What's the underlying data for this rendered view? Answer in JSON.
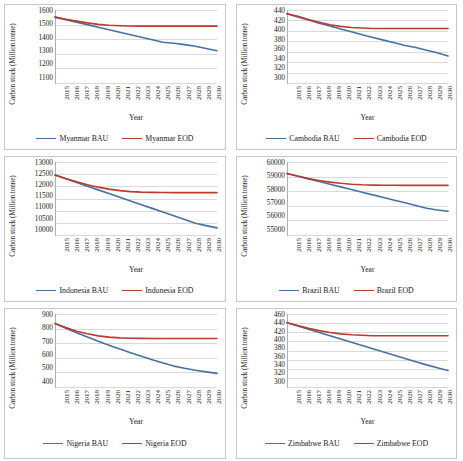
{
  "figure": {
    "layout": "2 columns x 3 rows of line charts",
    "shared_xlabel": "Year",
    "shared_ylabel": "Carbon stock (Million tonne)",
    "colors": {
      "bau_line": "#4472A4",
      "eod_line": "#BE3A2B",
      "gridline": "#D9D9D9",
      "panel_border": "#C8C8C8"
    }
  },
  "chart_data": [
    {
      "id": "myanmar",
      "type": "line",
      "title": "",
      "xlabel": "Year",
      "ylabel": "Carbon stock (Million tonne)",
      "x": [
        2015,
        2016,
        2017,
        2018,
        2019,
        2020,
        2021,
        2022,
        2023,
        2024,
        2025,
        2026,
        2027,
        2028,
        2029,
        2030
      ],
      "xtick_labels": [
        "2015",
        "2016",
        "2017",
        "2018",
        "2019",
        "2020",
        "2021",
        "2022",
        "2023",
        "2024",
        "2025",
        "2026",
        "2027",
        "2028",
        "2029",
        "2030"
      ],
      "ylim": [
        1100,
        1600
      ],
      "yticks": [
        1100,
        1200,
        1300,
        1400,
        1500,
        1600
      ],
      "ytick_labels": [
        "1100",
        "1200",
        "1300",
        "1400",
        "1500",
        "1600"
      ],
      "grid": true,
      "legend_position": "bottom",
      "series": [
        {
          "name": "Myanmar BAU",
          "color": "#4472A4",
          "values": [
            1552,
            1535,
            1518,
            1501,
            1484,
            1467,
            1450,
            1433,
            1416,
            1399,
            1382,
            1375,
            1366,
            1355,
            1340,
            1325
          ]
        },
        {
          "name": "Myanmar EOD",
          "color": "#BE3A2B",
          "values": [
            1552,
            1538,
            1525,
            1513,
            1503,
            1497,
            1494,
            1492,
            1491,
            1491,
            1491,
            1491,
            1491,
            1491,
            1491,
            1491
          ]
        }
      ]
    },
    {
      "id": "cambodia",
      "type": "line",
      "title": "",
      "xlabel": "Year",
      "ylabel": "Carbon stock (Million tonne)",
      "x": [
        2015,
        2016,
        2017,
        2018,
        2019,
        2020,
        2021,
        2022,
        2023,
        2024,
        2025,
        2026,
        2027,
        2028,
        2029,
        2030
      ],
      "xtick_labels": [
        "2015",
        "2016",
        "2017",
        "2018",
        "2019",
        "2020",
        "2021",
        "2022",
        "2023",
        "2024",
        "2025",
        "2026",
        "2027",
        "2028",
        "2029",
        "2030"
      ],
      "ylim": [
        300,
        440
      ],
      "yticks": [
        300,
        320,
        340,
        360,
        380,
        400,
        420,
        440
      ],
      "ytick_labels": [
        "300",
        "320",
        "340",
        "360",
        "380",
        "400",
        "420",
        "440"
      ],
      "grid": true,
      "legend_position": "bottom",
      "series": [
        {
          "name": "Cambodia BAU",
          "color": "#4472A4",
          "values": [
            433,
            427,
            421,
            415,
            410,
            404,
            399,
            393,
            388,
            383,
            378,
            373,
            369,
            364,
            359,
            353
          ]
        },
        {
          "name": "Cambodia EOD",
          "color": "#BE3A2B",
          "values": [
            433,
            428,
            422,
            417,
            412,
            409,
            407,
            406,
            405,
            405,
            405,
            405,
            405,
            405,
            405,
            405
          ]
        }
      ]
    },
    {
      "id": "indonesia",
      "type": "line",
      "title": "",
      "xlabel": "Year",
      "ylabel": "Carbon stock (Million tonne)",
      "x": [
        2015,
        2016,
        2017,
        2018,
        2019,
        2020,
        2021,
        2022,
        2023,
        2024,
        2025,
        2026,
        2027,
        2028,
        2029,
        2030
      ],
      "xtick_labels": [
        "2015",
        "2016",
        "2017",
        "2018",
        "2019",
        "2020",
        "2021",
        "2022",
        "2023",
        "2024",
        "2025",
        "2026",
        "2027",
        "2028",
        "2029",
        "2030"
      ],
      "ylim": [
        10000,
        13000
      ],
      "yticks": [
        10000,
        10500,
        11000,
        11500,
        12000,
        12500,
        13000
      ],
      "ytick_labels": [
        "10000",
        "10500",
        "11000",
        "11500",
        "12000",
        "12500",
        "13000"
      ],
      "grid": true,
      "legend_position": "bottom",
      "series": [
        {
          "name": "Indonesia BAU",
          "color": "#4472A4",
          "values": [
            12470,
            12320,
            12170,
            12020,
            11870,
            11720,
            11570,
            11420,
            11270,
            11120,
            10970,
            10820,
            10670,
            10520,
            10420,
            10330
          ]
        },
        {
          "name": "Indonesia EOD",
          "color": "#BE3A2B",
          "values": [
            12470,
            12330,
            12200,
            12080,
            11980,
            11900,
            11840,
            11800,
            11780,
            11770,
            11765,
            11760,
            11760,
            11760,
            11760,
            11760
          ]
        }
      ]
    },
    {
      "id": "brazil",
      "type": "line",
      "title": "",
      "xlabel": "Year",
      "ylabel": "Carbon stock (Million tonne)",
      "x": [
        2015,
        2016,
        2017,
        2018,
        2019,
        2020,
        2021,
        2022,
        2023,
        2024,
        2025,
        2026,
        2027,
        2028,
        2029,
        2030
      ],
      "xtick_labels": [
        "2015",
        "2016",
        "2017",
        "2018",
        "2019",
        "2020",
        "2021",
        "2022",
        "2023",
        "2024",
        "2025",
        "2026",
        "2027",
        "2028",
        "2029",
        "2030"
      ],
      "ylim": [
        55000,
        60000
      ],
      "yticks": [
        55000,
        56000,
        57000,
        58000,
        59000,
        60000
      ],
      "ytick_labels": [
        "55000",
        "56000",
        "57000",
        "58000",
        "59000",
        "60000"
      ],
      "grid": true,
      "legend_position": "bottom",
      "series": [
        {
          "name": "Brazil BAU",
          "color": "#4472A4",
          "values": [
            59220,
            59040,
            58860,
            58680,
            58500,
            58320,
            58140,
            57960,
            57780,
            57600,
            57420,
            57240,
            57060,
            56880,
            56760,
            56670
          ]
        },
        {
          "name": "Brazil EOD",
          "color": "#BE3A2B",
          "values": [
            59220,
            59050,
            58890,
            58750,
            58640,
            58560,
            58500,
            58460,
            58440,
            58430,
            58425,
            58420,
            58420,
            58420,
            58420,
            58420
          ]
        }
      ]
    },
    {
      "id": "nigeria",
      "type": "line",
      "title": "",
      "xlabel": "Year",
      "ylabel": "Carbon stock (Million tonne)",
      "x": [
        2015,
        2016,
        2017,
        2018,
        2019,
        2020,
        2021,
        2022,
        2023,
        2024,
        2025,
        2026,
        2027,
        2028,
        2029,
        2030
      ],
      "xtick_labels": [
        "2015",
        "2016",
        "2017",
        "2018",
        "2019",
        "2020",
        "2021",
        "2022",
        "2023",
        "2024",
        "2025",
        "2026",
        "2027",
        "2028",
        "2029",
        "2030"
      ],
      "ylim": [
        400,
        900
      ],
      "yticks": [
        400,
        500,
        600,
        700,
        800,
        900
      ],
      "ytick_labels": [
        "400",
        "500",
        "600",
        "700",
        "800",
        "900"
      ],
      "grid": true,
      "legend_position": "bottom",
      "series": [
        {
          "name": "Nigeria BAU",
          "color": "#4472A4",
          "values": [
            835,
            803,
            773,
            744,
            716,
            689,
            663,
            638,
            614,
            591,
            569,
            548,
            533,
            520,
            509,
            499
          ]
        },
        {
          "name": "Nigeria EOD",
          "color": "#BE3A2B",
          "values": [
            835,
            808,
            784,
            766,
            752,
            744,
            739,
            736,
            735,
            734,
            734,
            734,
            734,
            734,
            734,
            734
          ]
        }
      ]
    },
    {
      "id": "zimbabwe",
      "type": "line",
      "title": "",
      "xlabel": "Year",
      "ylabel": "Carbon stock (Million tonne)",
      "x": [
        2015,
        2016,
        2017,
        2018,
        2019,
        2020,
        2021,
        2022,
        2023,
        2024,
        2025,
        2026,
        2027,
        2028,
        2029,
        2030
      ],
      "xtick_labels": [
        "2015",
        "2016",
        "2017",
        "2018",
        "2019",
        "2020",
        "2021",
        "2022",
        "2023",
        "2024",
        "2025",
        "2026",
        "2027",
        "2028",
        "2029",
        "2030"
      ],
      "ylim": [
        300,
        460
      ],
      "yticks": [
        300,
        320,
        340,
        360,
        380,
        400,
        420,
        440,
        460
      ],
      "ytick_labels": [
        "300",
        "320",
        "340",
        "360",
        "380",
        "400",
        "420",
        "440",
        "460"
      ],
      "grid": true,
      "legend_position": "bottom",
      "series": [
        {
          "name": "Zimbabwe BAU",
          "color": "#4472A4",
          "values": [
            441,
            434,
            427,
            420,
            413,
            406,
            399,
            392,
            385,
            378,
            371,
            364,
            357,
            350,
            344,
            338
          ]
        },
        {
          "name": "Zimbabwe EOD",
          "color": "#BE3A2B",
          "values": [
            441,
            435,
            429,
            424,
            420,
            417,
            415,
            414,
            413,
            413,
            413,
            413,
            413,
            413,
            413,
            413
          ]
        }
      ]
    }
  ]
}
